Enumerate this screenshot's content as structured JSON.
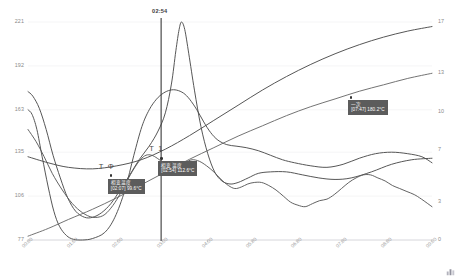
{
  "chart_data": {
    "type": "line",
    "title": "",
    "xlabel": "",
    "ylabel": "",
    "grid": true,
    "legend_position": "none",
    "x_axis": {
      "ticks": [
        "00:00",
        "01:00",
        "02:00",
        "03:00",
        "04:00",
        "05:00",
        "06:00",
        "07:00",
        "08:00",
        "09:00"
      ],
      "range": [
        "00:00",
        "09:00"
      ]
    },
    "y_axis_left": {
      "ticks": [
        "77",
        "106",
        "135",
        "163",
        "192",
        "221"
      ],
      "range": [
        77,
        221
      ],
      "unit": "°C"
    },
    "y_axis_right": {
      "ticks": [
        "0",
        "3",
        "7",
        "10",
        "13",
        "17"
      ],
      "range": [
        0,
        17
      ]
    },
    "marker": {
      "time_label": "02:54",
      "x_ratio": 0.3295
    },
    "series": [
      {
        "name": "series-a-left-drop",
        "color": "#4d4d4d",
        "axis": "left",
        "points": [
          [
            0.0,
            163
          ],
          [
            0.01,
            160
          ],
          [
            0.022,
            150
          ],
          [
            0.035,
            132
          ],
          [
            0.05,
            112
          ],
          [
            0.064,
            96
          ],
          [
            0.078,
            86
          ],
          [
            0.095,
            80
          ],
          [
            0.112,
            77.5
          ],
          [
            0.135,
            77
          ],
          [
            0.16,
            78
          ],
          [
            0.19,
            82
          ],
          [
            0.215,
            92
          ],
          [
            0.24,
            110
          ],
          [
            0.262,
            133
          ],
          [
            0.282,
            152
          ],
          [
            0.3,
            163
          ],
          [
            0.318,
            170
          ],
          [
            0.335,
            174
          ],
          [
            0.352,
            176
          ],
          [
            0.368,
            176
          ],
          [
            0.385,
            174
          ],
          [
            0.4,
            170
          ],
          [
            0.418,
            163
          ],
          [
            0.435,
            155
          ],
          [
            0.452,
            148
          ],
          [
            0.47,
            143
          ],
          [
            0.492,
            140
          ],
          [
            0.515,
            139
          ],
          [
            0.54,
            138
          ],
          [
            0.57,
            136
          ],
          [
            0.6,
            133
          ],
          [
            0.63,
            130
          ],
          [
            0.66,
            128
          ],
          [
            0.7,
            126
          ],
          [
            0.74,
            125
          ],
          [
            0.78,
            127
          ],
          [
            0.82,
            131
          ],
          [
            0.86,
            134
          ],
          [
            0.9,
            135
          ],
          [
            0.94,
            134
          ],
          [
            0.975,
            132
          ],
          [
            1.0,
            128
          ]
        ]
      },
      {
        "name": "series-b-peak",
        "color": "#4d4d4d",
        "axis": "left",
        "points": [
          [
            0.0,
            175
          ],
          [
            0.012,
            172
          ],
          [
            0.028,
            164
          ],
          [
            0.045,
            150
          ],
          [
            0.062,
            133
          ],
          [
            0.08,
            118
          ],
          [
            0.098,
            105
          ],
          [
            0.118,
            96
          ],
          [
            0.14,
            92
          ],
          [
            0.16,
            92
          ],
          [
            0.182,
            95
          ],
          [
            0.205,
            101
          ],
          [
            0.228,
            110
          ],
          [
            0.252,
            120
          ],
          [
            0.275,
            130
          ],
          [
            0.3,
            139
          ],
          [
            0.322,
            149
          ],
          [
            0.34,
            161
          ],
          [
            0.355,
            180
          ],
          [
            0.366,
            202
          ],
          [
            0.374,
            216
          ],
          [
            0.38,
            221
          ],
          [
            0.388,
            216
          ],
          [
            0.398,
            200
          ],
          [
            0.412,
            176
          ],
          [
            0.428,
            152
          ],
          [
            0.445,
            134
          ],
          [
            0.462,
            122
          ],
          [
            0.48,
            116
          ],
          [
            0.5,
            114
          ],
          [
            0.52,
            115
          ],
          [
            0.545,
            118
          ],
          [
            0.57,
            121
          ],
          [
            0.6,
            122
          ],
          [
            0.64,
            122
          ],
          [
            0.68,
            120
          ],
          [
            0.72,
            118
          ],
          [
            0.76,
            117
          ],
          [
            0.8,
            118
          ],
          [
            0.85,
            122
          ],
          [
            0.9,
            127
          ],
          [
            0.95,
            130
          ],
          [
            1.0,
            131
          ]
        ]
      },
      {
        "name": "series-c-rising-upper",
        "color": "#4d4d4d",
        "axis": "left",
        "points": [
          [
            0.0,
            132
          ],
          [
            0.05,
            128
          ],
          [
            0.1,
            125
          ],
          [
            0.16,
            124
          ],
          [
            0.22,
            126
          ],
          [
            0.28,
            130
          ],
          [
            0.34,
            137
          ],
          [
            0.4,
            146
          ],
          [
            0.46,
            156
          ],
          [
            0.52,
            166
          ],
          [
            0.58,
            176
          ],
          [
            0.64,
            185
          ],
          [
            0.7,
            193
          ],
          [
            0.76,
            200
          ],
          [
            0.82,
            206
          ],
          [
            0.88,
            211
          ],
          [
            0.94,
            215
          ],
          [
            1.0,
            218
          ]
        ]
      },
      {
        "name": "series-d-rising-lower",
        "color": "#6b6b6b",
        "axis": "right",
        "points": [
          [
            0.0,
            0.3
          ],
          [
            0.05,
            0.9
          ],
          [
            0.1,
            1.6
          ],
          [
            0.16,
            2.4
          ],
          [
            0.22,
            3.3
          ],
          [
            0.28,
            4.3
          ],
          [
            0.34,
            5.3
          ],
          [
            0.4,
            6.3
          ],
          [
            0.46,
            7.2
          ],
          [
            0.52,
            8.1
          ],
          [
            0.58,
            8.9
          ],
          [
            0.64,
            9.7
          ],
          [
            0.7,
            10.4
          ],
          [
            0.76,
            11.0
          ],
          [
            0.82,
            11.6
          ],
          [
            0.88,
            12.1
          ],
          [
            0.94,
            12.6
          ],
          [
            1.0,
            13.0
          ]
        ]
      },
      {
        "name": "series-e-jagged",
        "color": "#5a5a5a",
        "axis": "left",
        "points": [
          [
            0.0,
            150
          ],
          [
            0.02,
            142
          ],
          [
            0.04,
            132
          ],
          [
            0.06,
            121
          ],
          [
            0.085,
            110
          ],
          [
            0.11,
            101
          ],
          [
            0.135,
            95
          ],
          [
            0.16,
            92
          ],
          [
            0.185,
            93
          ],
          [
            0.205,
            98
          ],
          [
            0.225,
            106
          ],
          [
            0.245,
            116
          ],
          [
            0.262,
            124
          ],
          [
            0.278,
            130
          ],
          [
            0.292,
            133
          ],
          [
            0.306,
            133
          ],
          [
            0.32,
            131
          ],
          [
            0.336,
            128
          ],
          [
            0.352,
            126
          ],
          [
            0.37,
            126
          ],
          [
            0.388,
            128
          ],
          [
            0.406,
            130
          ],
          [
            0.424,
            129
          ],
          [
            0.442,
            126
          ],
          [
            0.46,
            122
          ],
          [
            0.478,
            117
          ],
          [
            0.496,
            113
          ],
          [
            0.512,
            111
          ],
          [
            0.528,
            112
          ],
          [
            0.544,
            114
          ],
          [
            0.56,
            115
          ],
          [
            0.578,
            115
          ],
          [
            0.596,
            113
          ],
          [
            0.614,
            110
          ],
          [
            0.632,
            106
          ],
          [
            0.65,
            102
          ],
          [
            0.668,
            100
          ],
          [
            0.686,
            99
          ],
          [
            0.704,
            101
          ],
          [
            0.722,
            103
          ],
          [
            0.74,
            104
          ],
          [
            0.758,
            107
          ],
          [
            0.776,
            111
          ],
          [
            0.794,
            115
          ],
          [
            0.812,
            118
          ],
          [
            0.83,
            120
          ],
          [
            0.848,
            120
          ],
          [
            0.866,
            118
          ],
          [
            0.884,
            116
          ],
          [
            0.902,
            113
          ],
          [
            0.92,
            111
          ],
          [
            0.938,
            109
          ],
          [
            0.956,
            107
          ],
          [
            0.974,
            104
          ],
          [
            1.0,
            99
          ]
        ]
      }
    ],
    "annotations": [
      {
        "tag": "T Φ",
        "title": "相变温度",
        "value": "[02:07] 99.6°C",
        "x_ratio": 0.205,
        "y_ratio": 0.705
      },
      {
        "tag": "T 1",
        "title": "相变温度",
        "value": "[02:54] 112.6°C",
        "x_ratio": 0.33,
        "y_ratio": 0.625
      },
      {
        "tag": "一次",
        "title": "一次",
        "value": "[07:47] 180.2°C",
        "x_ratio": 0.8,
        "y_ratio": 0.345
      }
    ]
  },
  "axes": {
    "y_left_ticks": [
      "221",
      "192",
      "163",
      "135",
      "106",
      "77"
    ],
    "y_right_ticks": [
      "17",
      "13",
      "10",
      "7",
      "3",
      "0"
    ],
    "x_ticks": [
      "00:00",
      "01:00",
      "02:00",
      "03:00",
      "04:00",
      "05:00",
      "06:00",
      "07:00",
      "08:00",
      "09:00"
    ]
  },
  "marker": {
    "time_label": "02:54"
  },
  "annotations": [
    {
      "tag": "T Φ",
      "title": "相变温度",
      "value": "[02:07] 99.6°C"
    },
    {
      "tag": "T 1",
      "title": "相变温度",
      "value": "[02:54] 112.6°C"
    },
    {
      "tag": "一次",
      "title": "一次",
      "value": "[07:47] 180.2°C"
    }
  ],
  "icon": {
    "corner": "chart-watermark-icon"
  }
}
